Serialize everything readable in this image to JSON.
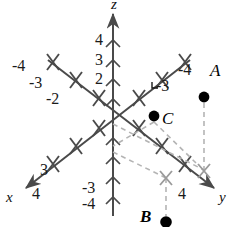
{
  "figure": {
    "kind": "3d-coordinate-axes",
    "background_color": "#ffffff",
    "axis_color": "#4a4a4a",
    "dash_color": "#b0b0b0",
    "marker_color": "#9a9a9a",
    "point_color": "#000000",
    "text_color": "#1a1a1a"
  },
  "axes": [
    {
      "id": "x",
      "label": "x",
      "direction": "lower-left",
      "label_x": 6,
      "label_y": 196,
      "positive_ticks": [
        {
          "value": "3",
          "x": 40,
          "y": 168
        },
        {
          "value": "4",
          "x": 32,
          "y": 192
        }
      ],
      "negative_ticks": [
        {
          "value": "-3",
          "x": 160,
          "y": 84
        },
        {
          "value": "-4",
          "x": 182,
          "y": 69
        }
      ]
    },
    {
      "id": "y",
      "label": "y",
      "direction": "lower-right",
      "label_x": 219,
      "label_y": 196,
      "positive_ticks": [
        {
          "value": "4",
          "x": 181,
          "y": 192
        }
      ],
      "negative_ticks": [
        {
          "value": "-4",
          "x": 14,
          "y": 64
        },
        {
          "value": "-3",
          "x": 31,
          "y": 80
        },
        {
          "value": "-2",
          "x": 48,
          "y": 95
        }
      ]
    },
    {
      "id": "z",
      "label": "z",
      "direction": "up",
      "label_x": 111,
      "label_y": -2,
      "positive_ticks": [
        {
          "value": "4",
          "x": 95,
          "y": 36
        },
        {
          "value": "3",
          "x": 95,
          "y": 56
        },
        {
          "value": "2",
          "x": 95,
          "y": 75
        }
      ],
      "negative_ticks": [
        {
          "value": "-3",
          "x": 84,
          "y": 186
        },
        {
          "value": "-4",
          "x": 84,
          "y": 202
        }
      ]
    }
  ],
  "points": [
    {
      "id": "A",
      "label": "A",
      "dot_x": 204,
      "dot_y": 97,
      "label_x": 210,
      "label_y": 70
    },
    {
      "id": "C",
      "label": "C",
      "dot_x": 154,
      "dot_y": 116,
      "label_x": 162,
      "label_y": 118
    },
    {
      "id": "B",
      "label": "B",
      "dot_x": 166,
      "dot_y": 222,
      "label_x": 140,
      "label_y": 214
    }
  ]
}
